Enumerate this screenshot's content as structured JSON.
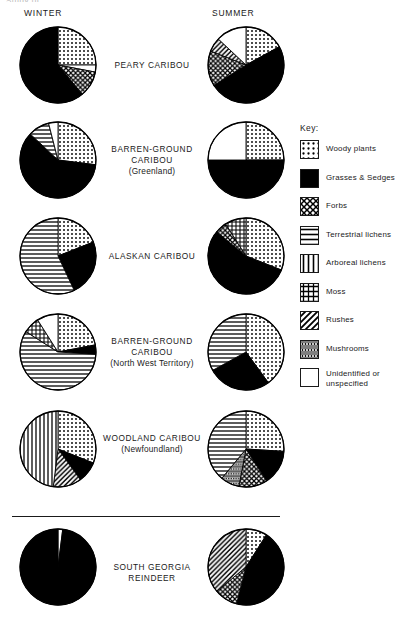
{
  "figure": {
    "clipped_top_text": "Study of",
    "columns": {
      "winter": "WINTER",
      "summer": "SUMMER"
    }
  },
  "key": {
    "title": "Key:",
    "items": [
      {
        "pattern": "dots",
        "label": "Woody plants",
        "color": "#000000"
      },
      {
        "pattern": "solid",
        "label": "Grasses & Sedges",
        "color": "#000000"
      },
      {
        "pattern": "crosshatch",
        "label": "Forbs",
        "color": "#000000"
      },
      {
        "pattern": "horizontal",
        "label": "Terrestrial lichens",
        "color": "#000000"
      },
      {
        "pattern": "vertical",
        "label": "Arboreal lichens",
        "color": "#000000"
      },
      {
        "pattern": "grid",
        "label": "Moss",
        "color": "#000000"
      },
      {
        "pattern": "diagonal",
        "label": "Rushes",
        "color": "#000000"
      },
      {
        "pattern": "mushroom",
        "label": "Mushrooms",
        "color": "#000000"
      },
      {
        "pattern": "blank",
        "label": "Unidentified or unspecified",
        "color": "#ffffff"
      }
    ]
  },
  "rows": [
    {
      "name": "PEARY CARIBOU",
      "sub": "",
      "winter": {
        "segments": [
          {
            "pattern": "dots",
            "value": 25
          },
          {
            "pattern": "blank",
            "value": 3
          },
          {
            "pattern": "crosshatch",
            "value": 11
          },
          {
            "pattern": "solid",
            "value": 61
          }
        ]
      },
      "summer": {
        "segments": [
          {
            "pattern": "dots",
            "value": 17
          },
          {
            "pattern": "solid",
            "value": 49
          },
          {
            "pattern": "crosshatch",
            "value": 15
          },
          {
            "pattern": "diagonal",
            "value": 6
          },
          {
            "pattern": "blank",
            "value": 13
          }
        ]
      }
    },
    {
      "name": "BARREN-GROUND CARIBOU",
      "sub": "(Greenland)",
      "winter": {
        "segments": [
          {
            "pattern": "dots",
            "value": 27
          },
          {
            "pattern": "solid",
            "value": 60
          },
          {
            "pattern": "horizontal",
            "value": 9
          },
          {
            "pattern": "blank",
            "value": 4
          }
        ]
      },
      "summer": {
        "segments": [
          {
            "pattern": "dots",
            "value": 25
          },
          {
            "pattern": "solid",
            "value": 50
          },
          {
            "pattern": "blank",
            "value": 25
          }
        ]
      }
    },
    {
      "name": "ALASKAN CARIBOU",
      "sub": "",
      "winter": {
        "segments": [
          {
            "pattern": "dots",
            "value": 19
          },
          {
            "pattern": "solid",
            "value": 24
          },
          {
            "pattern": "horizontal",
            "value": 57
          }
        ]
      },
      "summer": {
        "segments": [
          {
            "pattern": "dots",
            "value": 31
          },
          {
            "pattern": "solid",
            "value": 55
          },
          {
            "pattern": "crosshatch",
            "value": 5
          },
          {
            "pattern": "grid",
            "value": 9
          }
        ]
      }
    },
    {
      "name": "BARREN-GROUND CARIBOU",
      "sub": "(North West Territory)",
      "winter": {
        "segments": [
          {
            "pattern": "dots",
            "value": 22
          },
          {
            "pattern": "solid",
            "value": 4
          },
          {
            "pattern": "horizontal",
            "value": 58
          },
          {
            "pattern": "grid",
            "value": 7
          },
          {
            "pattern": "blank",
            "value": 9
          }
        ]
      },
      "summer": {
        "segments": [
          {
            "pattern": "dots",
            "value": 40
          },
          {
            "pattern": "solid",
            "value": 27
          },
          {
            "pattern": "horizontal",
            "value": 33
          }
        ]
      }
    },
    {
      "name": "WOODLAND CARIBOU",
      "sub": "(Newfoundland)",
      "winter": {
        "segments": [
          {
            "pattern": "dots",
            "value": 31
          },
          {
            "pattern": "solid",
            "value": 9
          },
          {
            "pattern": "diagonal",
            "value": 12
          },
          {
            "pattern": "vertical",
            "value": 48
          }
        ]
      },
      "summer": {
        "segments": [
          {
            "pattern": "dots",
            "value": 26
          },
          {
            "pattern": "solid",
            "value": 15
          },
          {
            "pattern": "crosshatch",
            "value": 12
          },
          {
            "pattern": "mushroom",
            "value": 8
          },
          {
            "pattern": "horizontal",
            "value": 39
          }
        ]
      }
    },
    {
      "name": "SOUTH GEORGIA REINDEER",
      "sub": "",
      "winter": {
        "segments": [
          {
            "pattern": "blank",
            "value": 2
          },
          {
            "pattern": "solid",
            "value": 98
          }
        ]
      },
      "summer": {
        "segments": [
          {
            "pattern": "dots",
            "value": 9
          },
          {
            "pattern": "solid",
            "value": 45
          },
          {
            "pattern": "crosshatch",
            "value": 10
          },
          {
            "pattern": "diagonal",
            "value": 36
          }
        ]
      }
    }
  ],
  "chart_data": {
    "type": "pie",
    "legend_position": "right",
    "units": "percent of diet",
    "categories": [
      "Woody plants",
      "Grasses & Sedges",
      "Forbs",
      "Terrestrial lichens",
      "Arboreal lichens",
      "Moss",
      "Rushes",
      "Mushrooms",
      "Unidentified or unspecified"
    ],
    "panels": [
      {
        "group": "PEARY CARIBOU",
        "season": "WINTER",
        "slices": [
          {
            "label": "Woody plants",
            "value": 25
          },
          {
            "label": "Unidentified or unspecified",
            "value": 3
          },
          {
            "label": "Forbs",
            "value": 11
          },
          {
            "label": "Grasses & Sedges",
            "value": 61
          }
        ]
      },
      {
        "group": "PEARY CARIBOU",
        "season": "SUMMER",
        "slices": [
          {
            "label": "Woody plants",
            "value": 17
          },
          {
            "label": "Grasses & Sedges",
            "value": 49
          },
          {
            "label": "Forbs",
            "value": 15
          },
          {
            "label": "Rushes",
            "value": 6
          },
          {
            "label": "Unidentified or unspecified",
            "value": 13
          }
        ]
      },
      {
        "group": "BARREN-GROUND CARIBOU (Greenland)",
        "season": "WINTER",
        "slices": [
          {
            "label": "Woody plants",
            "value": 27
          },
          {
            "label": "Grasses & Sedges",
            "value": 60
          },
          {
            "label": "Terrestrial lichens",
            "value": 9
          },
          {
            "label": "Unidentified or unspecified",
            "value": 4
          }
        ]
      },
      {
        "group": "BARREN-GROUND CARIBOU (Greenland)",
        "season": "SUMMER",
        "slices": [
          {
            "label": "Woody plants",
            "value": 25
          },
          {
            "label": "Grasses & Sedges",
            "value": 50
          },
          {
            "label": "Unidentified or unspecified",
            "value": 25
          }
        ]
      },
      {
        "group": "ALASKAN CARIBOU",
        "season": "WINTER",
        "slices": [
          {
            "label": "Woody plants",
            "value": 19
          },
          {
            "label": "Grasses & Sedges",
            "value": 24
          },
          {
            "label": "Terrestrial lichens",
            "value": 57
          }
        ]
      },
      {
        "group": "ALASKAN CARIBOU",
        "season": "SUMMER",
        "slices": [
          {
            "label": "Woody plants",
            "value": 31
          },
          {
            "label": "Grasses & Sedges",
            "value": 55
          },
          {
            "label": "Forbs",
            "value": 5
          },
          {
            "label": "Moss",
            "value": 9
          }
        ]
      },
      {
        "group": "BARREN-GROUND CARIBOU (North West Territory)",
        "season": "WINTER",
        "slices": [
          {
            "label": "Woody plants",
            "value": 22
          },
          {
            "label": "Grasses & Sedges",
            "value": 4
          },
          {
            "label": "Terrestrial lichens",
            "value": 58
          },
          {
            "label": "Moss",
            "value": 7
          },
          {
            "label": "Unidentified or unspecified",
            "value": 9
          }
        ]
      },
      {
        "group": "BARREN-GROUND CARIBOU (North West Territory)",
        "season": "SUMMER",
        "slices": [
          {
            "label": "Woody plants",
            "value": 40
          },
          {
            "label": "Grasses & Sedges",
            "value": 27
          },
          {
            "label": "Terrestrial lichens",
            "value": 33
          }
        ]
      },
      {
        "group": "WOODLAND CARIBOU (Newfoundland)",
        "season": "WINTER",
        "slices": [
          {
            "label": "Woody plants",
            "value": 31
          },
          {
            "label": "Grasses & Sedges",
            "value": 9
          },
          {
            "label": "Rushes",
            "value": 12
          },
          {
            "label": "Arboreal lichens",
            "value": 48
          }
        ]
      },
      {
        "group": "WOODLAND CARIBOU (Newfoundland)",
        "season": "SUMMER",
        "slices": [
          {
            "label": "Woody plants",
            "value": 26
          },
          {
            "label": "Grasses & Sedges",
            "value": 15
          },
          {
            "label": "Forbs",
            "value": 12
          },
          {
            "label": "Mushrooms",
            "value": 8
          },
          {
            "label": "Terrestrial lichens",
            "value": 39
          }
        ]
      },
      {
        "group": "SOUTH GEORGIA REINDEER",
        "season": "WINTER",
        "slices": [
          {
            "label": "Unidentified or unspecified",
            "value": 2
          },
          {
            "label": "Grasses & Sedges",
            "value": 98
          }
        ]
      },
      {
        "group": "SOUTH GEORGIA REINDEER",
        "season": "SUMMER",
        "slices": [
          {
            "label": "Woody plants",
            "value": 9
          },
          {
            "label": "Grasses & Sedges",
            "value": 45
          },
          {
            "label": "Forbs",
            "value": 10
          },
          {
            "label": "Rushes",
            "value": 36
          }
        ]
      }
    ]
  }
}
